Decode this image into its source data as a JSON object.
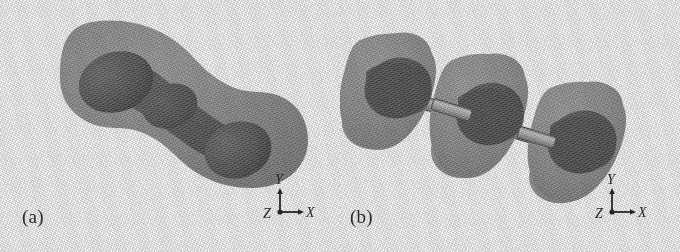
{
  "figure": {
    "kind": "scientific-figure",
    "background_color": "#ffffff",
    "width": 680,
    "height": 252,
    "style": "grayscale scanned halftone 3D isosurface rendering"
  },
  "panels": [
    {
      "id": "a",
      "label": "(a)",
      "description": "Single continuous peanut/dumbbell shaped outer isosurface enclosing a chain of darker inner lobes oriented diagonally from upper-left to lower-right",
      "outer_surface_color": "#8b8b8b",
      "inner_surface_color": "#555555",
      "axes": {
        "y_label": "Y",
        "x_label": "X",
        "z_label": "Z",
        "y_direction": "up",
        "x_direction": "right",
        "z_direction": "toward-viewer-lower-left"
      }
    },
    {
      "id": "b",
      "label": "(b)",
      "description": "Three separate lobed (capsule/torus-like) outer isosurfaces strung along a diagonal axis, joined by thin cylindrical bonds, each enclosing a darker inner sphere",
      "outer_surface_color": "#8f8f8f",
      "inner_surface_color": "#555555",
      "bond_color": "#b4b4b4",
      "axes": {
        "y_label": "Y",
        "x_label": "X",
        "z_label": "Z",
        "y_direction": "up",
        "x_direction": "right",
        "z_direction": "toward-viewer-lower-left"
      }
    }
  ],
  "colors": {
    "background": "#ffffff",
    "outer_isosurface": "#8b8b8b",
    "inner_isosurface": "#555555",
    "bond_cylinder": "#b4b4b4",
    "text": "#262626"
  }
}
